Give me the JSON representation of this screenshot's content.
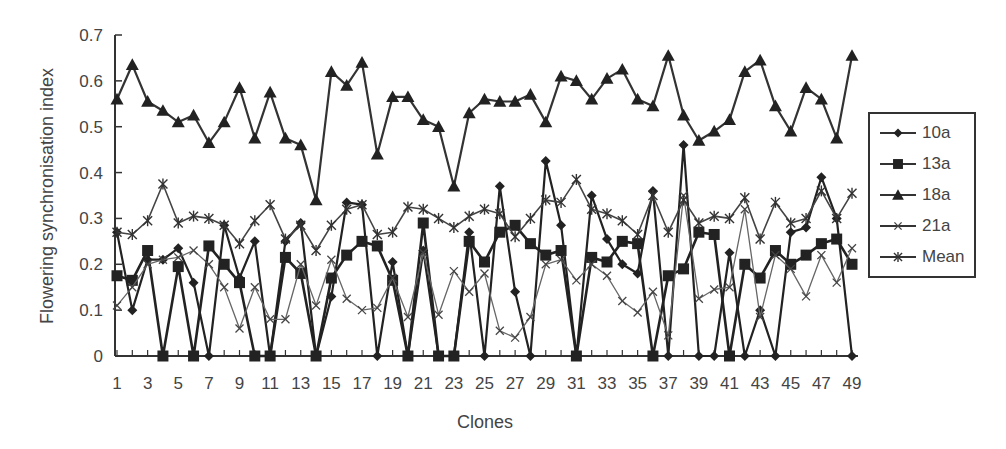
{
  "chart_data": {
    "type": "line",
    "title": "",
    "xlabel": "Clones",
    "ylabel": "Flowering synchronisation index",
    "ylim": [
      0,
      0.7
    ],
    "yticks": [
      "0",
      "0.1",
      "0.2",
      "0.3",
      "0.4",
      "0.5",
      "0.6",
      "0.7"
    ],
    "x": [
      1,
      2,
      3,
      4,
      5,
      6,
      7,
      8,
      9,
      10,
      11,
      12,
      13,
      14,
      15,
      16,
      17,
      18,
      19,
      20,
      21,
      22,
      23,
      24,
      25,
      26,
      27,
      28,
      29,
      30,
      31,
      32,
      33,
      34,
      35,
      36,
      37,
      38,
      39,
      40,
      41,
      42,
      43,
      44,
      45,
      46,
      47,
      48,
      49
    ],
    "xtick_labels": [
      "1",
      "3",
      "5",
      "7",
      "9",
      "11",
      "13",
      "15",
      "17",
      "19",
      "21",
      "23",
      "25",
      "27",
      "29",
      "31",
      "33",
      "35",
      "37",
      "39",
      "41",
      "43",
      "45",
      "47",
      "49"
    ],
    "legend_position": "right",
    "series": [
      {
        "name": "10a",
        "marker": "diamond",
        "values": [
          0.27,
          0.1,
          0.21,
          0.21,
          0.235,
          0.16,
          0,
          0.285,
          0.17,
          0.25,
          0,
          0.25,
          0.29,
          0,
          0.13,
          0.335,
          0.33,
          0,
          0.205,
          0,
          0.23,
          0,
          0,
          0.27,
          0,
          0.37,
          0.14,
          0,
          0.425,
          0.285,
          0,
          0.35,
          0.255,
          0.2,
          0.18,
          0.36,
          0,
          0.46,
          0,
          0,
          0.225,
          0,
          0.1,
          0,
          0.27,
          0.28,
          0.39,
          0.3,
          0
        ]
      },
      {
        "name": "13a",
        "marker": "square",
        "values": [
          0.175,
          0.165,
          0.23,
          0,
          0.195,
          0,
          0.24,
          0.2,
          0.16,
          0,
          0,
          0.215,
          0.18,
          0,
          0.17,
          0.22,
          0.25,
          0.24,
          0.165,
          0,
          0.29,
          0,
          0,
          0.25,
          0.205,
          0.27,
          0.285,
          0.245,
          0.22,
          0.23,
          0,
          0.215,
          0.205,
          0.25,
          0.245,
          0,
          0.175,
          0.19,
          0.27,
          0.265,
          0,
          0.2,
          0.17,
          0.23,
          0.2,
          0.22,
          0.245,
          0.255,
          0.2
        ]
      },
      {
        "name": "18a",
        "marker": "triangle",
        "values": [
          0.56,
          0.635,
          0.555,
          0.535,
          0.51,
          0.525,
          0.465,
          0.51,
          0.585,
          0.475,
          0.575,
          0.475,
          0.46,
          0.34,
          0.62,
          0.59,
          0.64,
          0.44,
          0.565,
          0.565,
          0.515,
          0.5,
          0.37,
          0.53,
          0.56,
          0.555,
          0.555,
          0.57,
          0.51,
          0.61,
          0.6,
          0.56,
          0.605,
          0.625,
          0.56,
          0.545,
          0.655,
          0.525,
          0.47,
          0.49,
          0.515,
          0.62,
          0.645,
          0.545,
          0.49,
          0.585,
          0.56,
          0.475,
          0.655
        ]
      },
      {
        "name": "21a",
        "marker": "x",
        "values": [
          0.11,
          0.15,
          0.2,
          0.21,
          0.215,
          0.23,
          0.2,
          0.15,
          0.06,
          0.15,
          0.08,
          0.08,
          0.2,
          0.11,
          0.21,
          0.125,
          0.1,
          0.105,
          0.17,
          0.085,
          0.225,
          0.09,
          0.185,
          0.14,
          0.18,
          0.055,
          0.04,
          0.085,
          0.2,
          0.21,
          0.165,
          0.2,
          0.175,
          0.12,
          0.095,
          0.14,
          0.045,
          0.35,
          0.125,
          0.145,
          0.15,
          0.32,
          0.085,
          0.22,
          0.19,
          0.13,
          0.22,
          0.16,
          0.235
        ]
      },
      {
        "name": "Mean",
        "marker": "star",
        "values": [
          0.27,
          0.265,
          0.295,
          0.375,
          0.29,
          0.305,
          0.3,
          0.285,
          0.245,
          0.295,
          0.33,
          0.255,
          0.285,
          0.23,
          0.285,
          0.32,
          0.33,
          0.265,
          0.27,
          0.325,
          0.32,
          0.3,
          0.28,
          0.305,
          0.32,
          0.31,
          0.26,
          0.3,
          0.34,
          0.335,
          0.385,
          0.32,
          0.31,
          0.295,
          0.265,
          0.35,
          0.27,
          0.34,
          0.29,
          0.305,
          0.3,
          0.345,
          0.255,
          0.335,
          0.29,
          0.3,
          0.36,
          0.3,
          0.355
        ]
      }
    ]
  }
}
